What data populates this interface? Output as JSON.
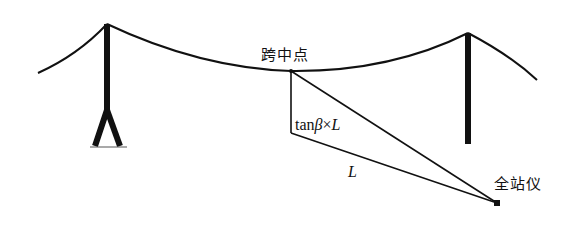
{
  "diagram": {
    "type": "overhead-line-sag-measurement",
    "labels": {
      "midspan": "跨中点",
      "height_expr_prefix": "tan",
      "height_expr_beta": "β",
      "height_expr_times": "×",
      "height_expr_L": "L",
      "distance": "L",
      "instrument": "全站仪"
    },
    "colors": {
      "line": "#111111",
      "background": "#ffffff"
    },
    "elements": [
      "left-tower",
      "right-tower",
      "conductor-cable",
      "midspan-point",
      "vertical-offset-line",
      "horizontal-distance-line",
      "sight-line",
      "total-station"
    ]
  }
}
